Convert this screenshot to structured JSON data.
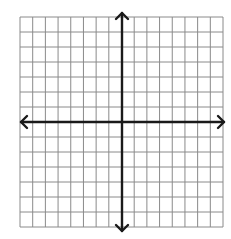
{
  "diagram": {
    "type": "coordinate-grid",
    "grid": {
      "left": 20,
      "top": 17,
      "right": 223,
      "bottom": 227,
      "columns": 16,
      "rows": 14,
      "line_color": "#8a8a8a",
      "background": "#ffffff"
    },
    "axes": {
      "color": "#1a1a1a",
      "x_axis": {
        "y": 122,
        "from": 21,
        "to": 224,
        "arrows": "both"
      },
      "y_axis": {
        "x": 122,
        "from": 13,
        "to": 231,
        "arrows": "both"
      }
    },
    "labels": []
  }
}
